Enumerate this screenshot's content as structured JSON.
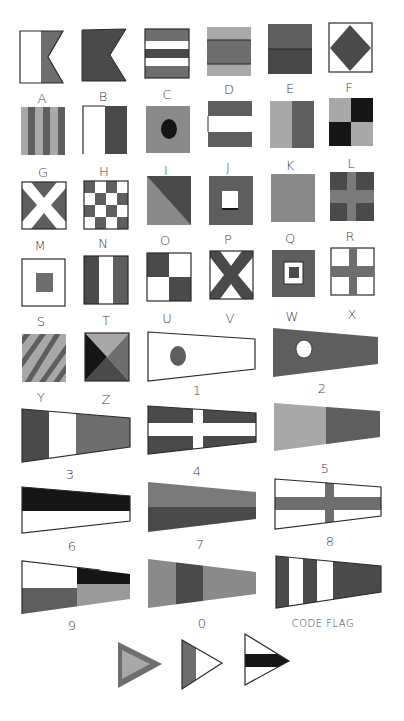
{
  "colors": {
    "white": "#ffffff",
    "light": "#a8a8a8",
    "mid": "#6e6e6e",
    "dark": "#4a4a4a",
    "black": "#151515",
    "outline": "#2a2a2a"
  },
  "letter_flags": [
    {
      "label": "A",
      "x": 20,
      "y": 31
    },
    {
      "label": "B",
      "x": 82,
      "y": 31
    },
    {
      "label": "C",
      "x": 145,
      "y": 29
    },
    {
      "label": "D",
      "x": 207,
      "y": 27
    },
    {
      "label": "E",
      "x": 268,
      "y": 24
    },
    {
      "label": "F",
      "x": 329,
      "y": 23
    },
    {
      "label": "G",
      "x": 21,
      "y": 107
    },
    {
      "label": "H",
      "x": 83,
      "y": 106
    },
    {
      "label": "I",
      "x": 146,
      "y": 106
    },
    {
      "label": "J",
      "x": 208,
      "y": 101
    },
    {
      "label": "K",
      "x": 270,
      "y": 101
    },
    {
      "label": "L",
      "x": 329,
      "y": 98
    },
    {
      "label": "M",
      "x": 22,
      "y": 182
    },
    {
      "label": "N",
      "x": 84,
      "y": 181
    },
    {
      "label": "O",
      "x": 147,
      "y": 176
    },
    {
      "label": "P",
      "x": 209,
      "y": 176
    },
    {
      "label": "Q",
      "x": 271,
      "y": 174
    },
    {
      "label": "R",
      "x": 330,
      "y": 172
    },
    {
      "label": "M",
      "x": 22,
      "y": 259
    },
    {
      "label": "N",
      "x": 84,
      "y": 256
    },
    {
      "label": "O",
      "x": 147,
      "y": 253
    },
    {
      "label": "P",
      "x": 210,
      "y": 251
    },
    {
      "label": "Q",
      "x": 272,
      "y": 250
    },
    {
      "label": "R",
      "x": 331,
      "y": 248
    },
    {
      "label": "S",
      "x": 22,
      "y": 334
    },
    {
      "label": "T",
      "x": 85,
      "y": 333
    }
  ],
  "labels": {
    "row1": [
      "A",
      "B",
      "C",
      "D",
      "E",
      "F"
    ],
    "row2": [
      "G",
      "H",
      "I",
      "J",
      "K",
      "L"
    ],
    "row3": [
      "M",
      "N",
      "O",
      "P",
      "Q",
      "R"
    ],
    "row4": [
      "S",
      "T",
      "U",
      "V",
      "W",
      "X"
    ],
    "row5": [
      "Y",
      "Z",
      "1",
      "2"
    ],
    "row6": [
      "3",
      "4",
      "5"
    ],
    "row7": [
      "6",
      "7",
      "8"
    ],
    "row8": [
      "9",
      "0",
      "CODE FLAG"
    ]
  }
}
